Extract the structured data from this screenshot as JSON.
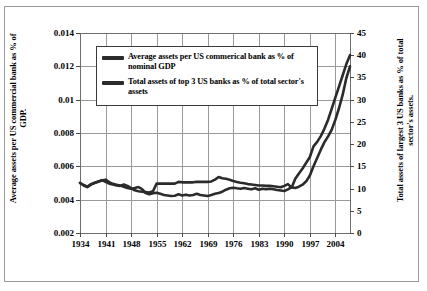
{
  "chart_data": {
    "type": "line",
    "title": "",
    "xlabel": "",
    "ylabel": "Average assets per US commercial bank as % of GDP.",
    "y2label": "Total assets of largest 3 US banks as % of total sector's assets.",
    "grid": true,
    "legend_position": "top-center-inside",
    "xlim": [
      1934,
      2008
    ],
    "xticks": [
      "1934",
      "1941",
      "1948",
      "1955",
      "1962",
      "1969",
      "1976",
      "1983",
      "1990",
      "1997",
      "2004"
    ],
    "xtick_values": [
      1934,
      1941,
      1948,
      1955,
      1962,
      1969,
      1976,
      1983,
      1990,
      1997,
      2004
    ],
    "ylim": [
      0.002,
      0.014
    ],
    "yticks": [
      "0.002",
      "0.004",
      "0.006",
      "0.008",
      "0.01",
      "0.012",
      "0.014"
    ],
    "ytick_values": [
      0.002,
      0.004,
      0.006,
      0.008,
      0.01,
      0.012,
      0.014
    ],
    "y2lim": [
      0,
      45
    ],
    "y2ticks": [
      "0",
      "5",
      "10",
      "15",
      "20",
      "25",
      "30",
      "35",
      "40",
      "45"
    ],
    "y2tick_values": [
      0,
      5,
      10,
      15,
      20,
      25,
      30,
      35,
      40,
      45
    ],
    "line_color": "#2b2b2b",
    "grid_color": "#9a9a9a",
    "series": [
      {
        "name": "Average assets per US commerical bank as % of nominal GDP",
        "axis": "left",
        "x": [
          1934,
          1935,
          1936,
          1937,
          1938,
          1939,
          1940,
          1941,
          1942,
          1943,
          1944,
          1945,
          1946,
          1947,
          1948,
          1949,
          1950,
          1951,
          1952,
          1953,
          1954,
          1955,
          1956,
          1957,
          1958,
          1959,
          1960,
          1961,
          1962,
          1963,
          1964,
          1965,
          1966,
          1967,
          1968,
          1969,
          1970,
          1971,
          1972,
          1973,
          1974,
          1975,
          1976,
          1977,
          1978,
          1979,
          1980,
          1981,
          1982,
          1983,
          1984,
          1985,
          1986,
          1987,
          1988,
          1989,
          1990,
          1991,
          1992,
          1993,
          1994,
          1995,
          1996,
          1997,
          1998,
          1999,
          2000,
          2001,
          2002,
          2003,
          2004,
          2005,
          2006,
          2007,
          2008
        ],
        "y": [
          0.005,
          0.00485,
          0.00475,
          0.0049,
          0.005,
          0.00508,
          0.00515,
          0.0052,
          0.00505,
          0.00495,
          0.0049,
          0.00485,
          0.00478,
          0.0047,
          0.00465,
          0.0047,
          0.00476,
          0.00463,
          0.0044,
          0.00432,
          0.00438,
          0.00442,
          0.00435,
          0.00428,
          0.00425,
          0.00422,
          0.00424,
          0.00432,
          0.00425,
          0.0043,
          0.00425,
          0.00428,
          0.00435,
          0.00428,
          0.00425,
          0.00422,
          0.00428,
          0.00435,
          0.0044,
          0.00448,
          0.0046,
          0.00468,
          0.00472,
          0.00468,
          0.00465,
          0.0047,
          0.00466,
          0.00462,
          0.00468,
          0.0046,
          0.00466,
          0.00462,
          0.00465,
          0.00462,
          0.00458,
          0.00455,
          0.00452,
          0.00462,
          0.00475,
          0.0047,
          0.00478,
          0.0049,
          0.0051,
          0.00545,
          0.006,
          0.0065,
          0.007,
          0.00745,
          0.0078,
          0.0082,
          0.0088,
          0.0095,
          0.0103,
          0.0113,
          0.012
        ]
      },
      {
        "name": "Total assets of top 3 US banks as % of total sector's assets",
        "axis": "right",
        "x": [
          1934,
          1935,
          1936,
          1937,
          1938,
          1939,
          1940,
          1941,
          1942,
          1943,
          1944,
          1945,
          1946,
          1947,
          1948,
          1949,
          1950,
          1951,
          1952,
          1953,
          1954,
          1955,
          1956,
          1957,
          1958,
          1959,
          1960,
          1961,
          1962,
          1963,
          1964,
          1965,
          1966,
          1967,
          1968,
          1969,
          1970,
          1971,
          1972,
          1973,
          1974,
          1975,
          1976,
          1977,
          1978,
          1979,
          1980,
          1981,
          1982,
          1983,
          1984,
          1985,
          1986,
          1987,
          1988,
          1989,
          1990,
          1991,
          1992,
          1993,
          1994,
          1995,
          1996,
          1997,
          1998,
          1999,
          2000,
          2001,
          2002,
          2003,
          2004,
          2005,
          2006,
          2007,
          2008
        ],
        "y": [
          11.3,
          10.8,
          10.4,
          11.0,
          11.3,
          11.6,
          11.9,
          11.5,
          11.1,
          10.9,
          10.7,
          10.6,
          10.9,
          10.6,
          10.1,
          9.6,
          9.4,
          9.3,
          9.2,
          9.1,
          9.4,
          11.1,
          11.1,
          11.1,
          11.1,
          11.1,
          11.1,
          11.5,
          11.4,
          11.4,
          11.4,
          11.4,
          11.5,
          11.5,
          11.5,
          11.5,
          11.6,
          12.0,
          12.6,
          12.3,
          12.2,
          12.0,
          11.7,
          11.5,
          11.3,
          11.2,
          11.0,
          10.9,
          10.8,
          10.7,
          10.7,
          10.6,
          10.6,
          10.5,
          10.4,
          10.3,
          10.6,
          11.0,
          10.2,
          12.2,
          13.4,
          14.5,
          15.8,
          17.1,
          19.5,
          20.5,
          21.8,
          23.5,
          25.5,
          28.0,
          30.5,
          33.0,
          35.5,
          38.0,
          40.0
        ]
      }
    ]
  },
  "axes": {
    "left_title": "Average assets per US commercial bank as % of GDP.",
    "right_title": "Total assets of largest 3 US banks as % of total sector's assets."
  },
  "legend": {
    "items": [
      {
        "label": "Average assets per US commerical bank as % of nominal GDP"
      },
      {
        "label": "Total assets of top 3 US banks as % of total sector's assets"
      }
    ]
  }
}
